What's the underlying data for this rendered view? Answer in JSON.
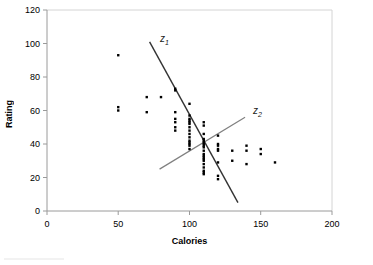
{
  "chart_data": {
    "type": "scatter",
    "title": "",
    "xlabel": "Calories",
    "ylabel": "Rating",
    "xlim": [
      0,
      200
    ],
    "ylim": [
      0,
      120
    ],
    "xticks": [
      0,
      50,
      100,
      150,
      200
    ],
    "yticks": [
      0,
      20,
      40,
      60,
      80,
      100,
      120
    ],
    "grid": false,
    "legend": "none",
    "marker_color": "#000000",
    "marker_shape": "square",
    "x": [
      50,
      50,
      50,
      70,
      70,
      80,
      90,
      90,
      90,
      90,
      90,
      90,
      90,
      100,
      100,
      100,
      100,
      100,
      100,
      100,
      100,
      100,
      100,
      100,
      100,
      100,
      100,
      100,
      110,
      110,
      110,
      110,
      110,
      110,
      110,
      110,
      110,
      110,
      110,
      110,
      110,
      110,
      110,
      110,
      110,
      110,
      110,
      110,
      120,
      120,
      120,
      120,
      120,
      120,
      120,
      120,
      130,
      130,
      140,
      140,
      140,
      150,
      150,
      160
    ],
    "y": [
      93,
      62,
      60,
      68,
      59,
      68,
      73,
      72,
      59,
      55,
      53,
      50,
      48,
      64,
      57,
      55,
      54,
      53,
      52,
      50,
      48,
      46,
      44,
      42,
      41,
      40,
      39,
      37,
      53,
      51,
      46,
      43,
      42,
      41,
      40,
      39,
      38,
      36,
      34,
      33,
      32,
      31,
      30,
      28,
      26,
      24,
      23,
      22,
      45,
      40,
      39,
      37,
      36,
      29,
      21,
      19,
      36,
      30,
      39,
      36,
      28,
      37,
      34,
      29
    ],
    "annotations": [
      {
        "name": "z1",
        "label": "z",
        "subscript": "1",
        "line_color": "#333333",
        "x_start": 72,
        "y_start": 101,
        "x_end": 134,
        "y_end": 5
      },
      {
        "name": "z2",
        "label": "z",
        "subscript": "2",
        "line_color": "#808080",
        "x_start": 79,
        "y_start": 25,
        "x_end": 139,
        "y_end": 56
      }
    ]
  },
  "axes": {
    "ylabel": "Rating",
    "xlabel": "Calories",
    "ytick_labels": [
      "120",
      "100",
      "80",
      "60",
      "40",
      "20",
      "0"
    ],
    "xtick_labels": [
      "0",
      "50",
      "100",
      "150",
      "200"
    ]
  },
  "colors": {
    "axis_line": "#9a9a9a",
    "plot_border": "#d4d4d4",
    "marker": "#000000",
    "z1_line": "#333333",
    "z2_line": "#8c8c8c",
    "text": "#000000"
  }
}
